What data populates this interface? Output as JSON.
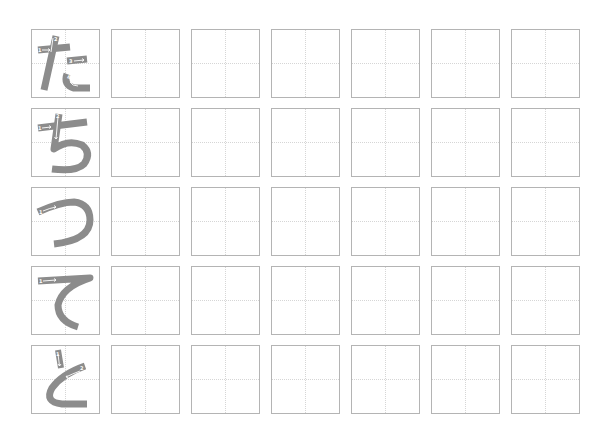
{
  "worksheet": {
    "layout": {
      "rows": 5,
      "columns": 7,
      "practice_boxes_per_row": 6
    },
    "colors": {
      "box_border": "#b4b4b4",
      "guide_line": "#d6d6d6",
      "model_stroke": "#8c8c8c",
      "stroke_arrow": "#ffffff"
    },
    "rows": [
      {
        "character": "た",
        "romaji": "ta",
        "stroke_count": 4,
        "stroke_numbers": [
          "1",
          "2",
          "3",
          "4"
        ]
      },
      {
        "character": "ち",
        "romaji": "chi",
        "stroke_count": 3,
        "stroke_numbers": [
          "1",
          "2",
          "3"
        ]
      },
      {
        "character": "つ",
        "romaji": "tsu",
        "stroke_count": 1,
        "stroke_numbers": [
          "1"
        ]
      },
      {
        "character": "て",
        "romaji": "te",
        "stroke_count": 1,
        "stroke_numbers": [
          "1"
        ]
      },
      {
        "character": "と",
        "romaji": "to",
        "stroke_count": 2,
        "stroke_numbers": [
          "1",
          "2"
        ]
      }
    ]
  }
}
